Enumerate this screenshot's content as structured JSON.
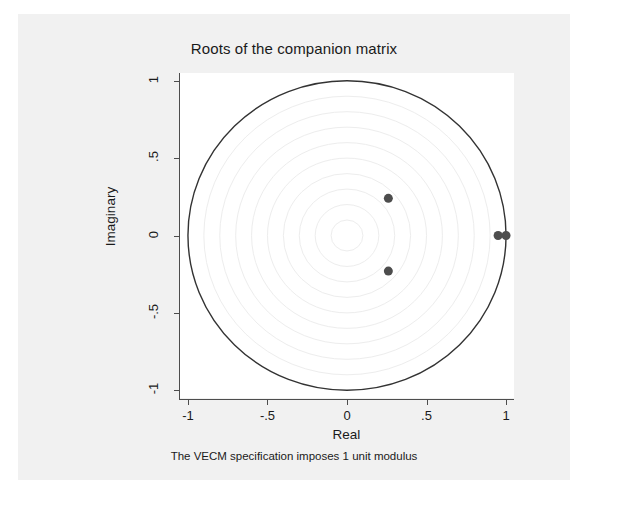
{
  "chart_data": {
    "type": "scatter",
    "title": "Roots of the companion matrix",
    "xlabel": "Real",
    "ylabel": "Imaginary",
    "note": "The VECM specification imposes 1 unit modulus",
    "xlim": [
      -1.05,
      1.05
    ],
    "ylim": [
      -1.05,
      1.05
    ],
    "xticks": [
      -1,
      -0.5,
      0,
      0.5,
      1
    ],
    "xticklabels": [
      "-1",
      "-.5",
      "0",
      ".5",
      "1"
    ],
    "yticks": [
      1,
      0.5,
      0,
      -0.5,
      -1
    ],
    "yticklabels": [
      "1",
      ".5",
      "0",
      "-.5",
      "-1"
    ],
    "grid": "concentric-circles",
    "grid_radii": [
      0.1,
      0.2,
      0.3,
      0.4,
      0.5,
      0.6,
      0.7,
      0.8,
      0.9
    ],
    "grid_color": "#ededed",
    "unit_circle": {
      "radius": 1,
      "color": "#333333"
    },
    "legend": "none",
    "marker_color": "#4d4d4d",
    "marker_size": 6,
    "points": [
      {
        "real": 1.0,
        "imaginary": 0.0,
        "label": "unit root"
      },
      {
        "real": 0.95,
        "imaginary": 0.0,
        "label": "real root"
      },
      {
        "real": 0.26,
        "imaginary": 0.24,
        "label": "complex root"
      },
      {
        "real": 0.26,
        "imaginary": -0.23,
        "label": "complex conjugate root"
      }
    ],
    "series": [
      {
        "name": "roots",
        "x": [
          1.0,
          0.95,
          0.26,
          0.26
        ],
        "y": [
          0.0,
          0.0,
          0.24,
          -0.23
        ]
      }
    ]
  },
  "colors": {
    "page_background": "#ffffff",
    "canvas_background": "#f1f1f1",
    "plot_background": "#ffffff",
    "axis": "#4d4d4d",
    "text": "#1a1a1a",
    "marker": "#4d4d4d",
    "circle": "#333333",
    "gridline": "#ededed"
  }
}
